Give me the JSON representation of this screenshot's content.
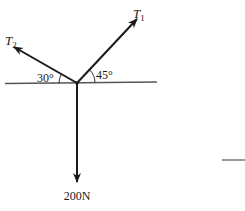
{
  "diagram": {
    "type": "free-body-diagram",
    "forces": [
      {
        "id": "T1",
        "label_main": "T",
        "label_sub": "1",
        "direction": "up-right",
        "angle_from_horizontal_deg": 45,
        "angle_label": "45°"
      },
      {
        "id": "T2",
        "label_main": "T",
        "label_sub": "2",
        "direction": "up-left",
        "angle_from_horizontal_deg": 30,
        "angle_label": "30°"
      },
      {
        "id": "W",
        "label": "200N",
        "direction": "down"
      }
    ],
    "colors": {
      "line": "#1a1a1a",
      "horizontal": "#555555"
    }
  }
}
